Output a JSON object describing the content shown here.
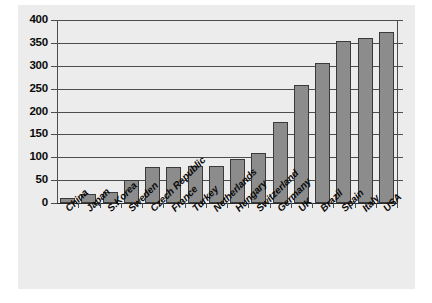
{
  "chart_data": {
    "type": "bar",
    "title": "",
    "subtitle": "",
    "xlabel": "",
    "ylabel": "",
    "ylim": [
      0,
      400
    ],
    "ytick_step": 50,
    "yticks": [
      400,
      350,
      300,
      250,
      200,
      150,
      100,
      50,
      0
    ],
    "grid": true,
    "legend": null,
    "categories": [
      "China",
      "Japan",
      "S.Korea",
      "Sweden",
      "Czech Republic",
      "France",
      "Turkey",
      "Netherlands",
      "Hungary",
      "Switzerland",
      "Germany",
      "UK",
      "Brazil",
      "Spain",
      "Italy",
      "USA"
    ],
    "values": [
      12,
      20,
      25,
      50,
      79,
      79,
      82,
      82,
      97,
      110,
      178,
      258,
      305,
      355,
      360,
      373
    ],
    "colors": {
      "bar_fill": "#8c8c8c",
      "bar_border": "#3a3a3a",
      "panel_background": "#ececec",
      "gridline": "#4d4d4d",
      "axis": "#4d4d4d",
      "text": "#0a0a0a",
      "page_background": "#ffffff"
    }
  }
}
